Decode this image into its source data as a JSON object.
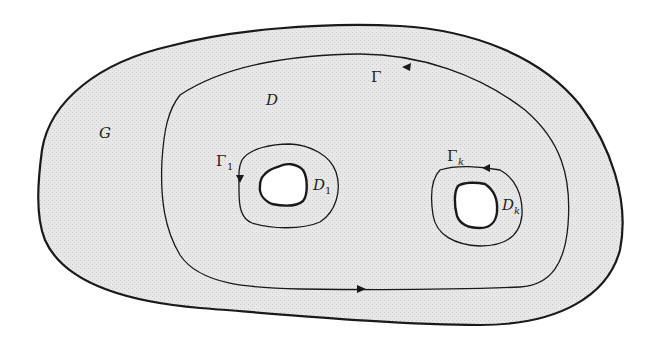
{
  "figure": {
    "colors": {
      "background": "#ffffff",
      "shading": "#e6e6e6",
      "stroke": "#1a1a1a",
      "hole_fill": "#ffffff"
    },
    "labels": {
      "outer_region": "G",
      "domain": "D",
      "outer_contour": "Γ",
      "inner_contour_1": "Γ",
      "inner_contour_1_sub": "1",
      "inner_contour_k": "Γ",
      "inner_contour_k_sub": "k",
      "hole_1": "D",
      "hole_1_sub": "1",
      "hole_k": "D",
      "hole_k_sub": "k"
    },
    "arrows": {
      "outer_contour_top": "left",
      "outer_contour_bottom": "right",
      "inner_contour_1": "down",
      "inner_contour_k": "left"
    }
  }
}
